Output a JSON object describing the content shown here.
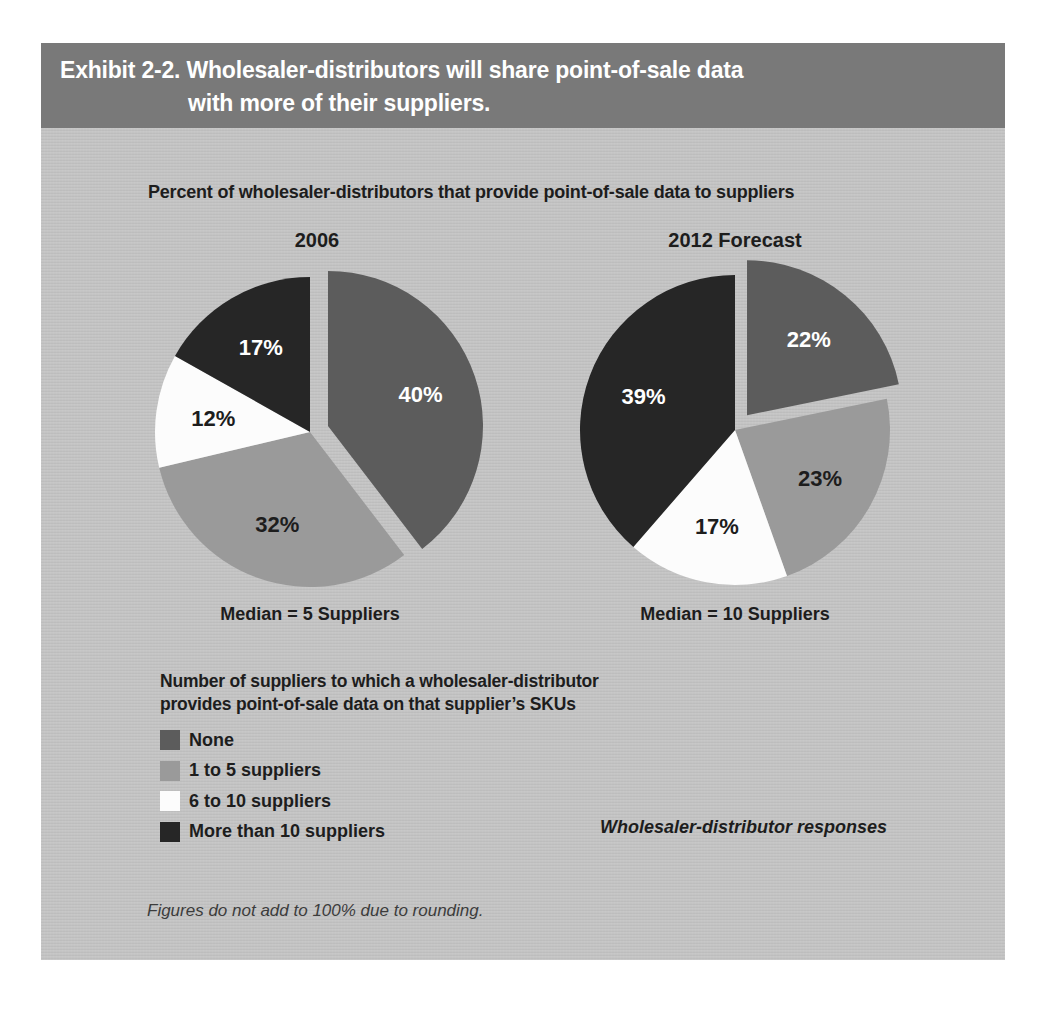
{
  "page": {
    "header": {
      "line1": "Exhibit 2-2. Wholesaler-distributors will share point-of-sale data",
      "line2": "with more of their suppliers."
    },
    "subtitle": "Percent of wholesaler-distributors that provide point-of-sale data to suppliers",
    "source_note": "Wholesaler-distributor responses",
    "footnote": "Figures do not add to 100% due to rounding."
  },
  "colors": {
    "page_bg": "#ffffff",
    "panel_bg": "#c3c3c3",
    "header_bg": "#797979",
    "header_text": "#ffffff",
    "body_text": "#1d1d1d",
    "slice_none": "#5c5c5c",
    "slice_1_to_5": "#9a9a9a",
    "slice_6_to_10": "#fcfcfc",
    "slice_more_than_10": "#262626"
  },
  "legend": {
    "title_line1": "Number of suppliers to which a wholesaler-distributor",
    "title_line2": "provides point-of-sale data on that supplier’s SKUs",
    "items": [
      {
        "label": "None",
        "color": "#5c5c5c"
      },
      {
        "label": "1 to 5 suppliers",
        "color": "#9a9a9a"
      },
      {
        "label": "6 to 10 suppliers",
        "color": "#fcfcfc"
      },
      {
        "label": "More than 10 suppliers",
        "color": "#262626"
      }
    ]
  },
  "chart_data": [
    {
      "type": "pie",
      "title": "2006",
      "caption": "Median = 5 Suppliers",
      "slices": [
        {
          "label": "None",
          "value": 40,
          "display": "40%",
          "color": "#5c5c5c",
          "label_color": "#ffffff",
          "exploded": true
        },
        {
          "label": "1 to 5 suppliers",
          "value": 32,
          "display": "32%",
          "color": "#9a9a9a",
          "label_color": "#1d1d1d",
          "exploded": false
        },
        {
          "label": "6 to 10 suppliers",
          "value": 12,
          "display": "12%",
          "color": "#fcfcfc",
          "label_color": "#1d1d1d",
          "exploded": false
        },
        {
          "label": "More than 10 suppliers",
          "value": 17,
          "display": "17%",
          "color": "#262626",
          "label_color": "#ffffff",
          "exploded": false
        }
      ]
    },
    {
      "type": "pie",
      "title": "2012 Forecast",
      "caption": "Median = 10 Suppliers",
      "slices": [
        {
          "label": "None",
          "value": 22,
          "display": "22%",
          "color": "#5c5c5c",
          "label_color": "#ffffff",
          "exploded": true
        },
        {
          "label": "1 to 5 suppliers",
          "value": 23,
          "display": "23%",
          "color": "#9a9a9a",
          "label_color": "#1d1d1d",
          "exploded": false
        },
        {
          "label": "6 to 10 suppliers",
          "value": 17,
          "display": "17%",
          "color": "#fcfcfc",
          "label_color": "#1d1d1d",
          "exploded": false
        },
        {
          "label": "More than 10 suppliers",
          "value": 39,
          "display": "39%",
          "color": "#262626",
          "label_color": "#ffffff",
          "exploded": false
        }
      ]
    }
  ]
}
